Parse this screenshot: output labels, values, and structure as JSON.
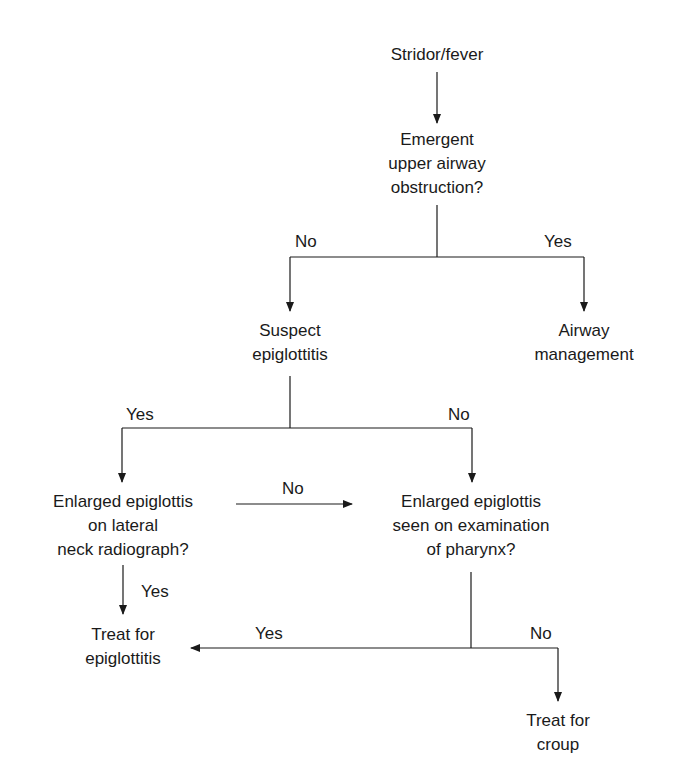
{
  "diagram": {
    "type": "flowchart",
    "nodes": {
      "start": {
        "lines": [
          "Stridor/fever"
        ]
      },
      "obstruction": {
        "lines": [
          "Emergent",
          "upper airway",
          "obstruction?"
        ]
      },
      "suspect": {
        "lines": [
          "Suspect",
          "epiglottitis"
        ]
      },
      "airway": {
        "lines": [
          "Airway",
          "management"
        ]
      },
      "radiograph": {
        "lines": [
          "Enlarged epiglottis",
          "on lateral",
          "neck radiograph?"
        ]
      },
      "pharynx": {
        "lines": [
          "Enlarged epiglottis",
          "seen on examination",
          "of pharynx?"
        ]
      },
      "treat_epi": {
        "lines": [
          "Treat for",
          "epiglottitis"
        ]
      },
      "treat_croup": {
        "lines": [
          "Treat for",
          "croup"
        ]
      }
    },
    "edge_labels": {
      "obstruction_no": "No",
      "obstruction_yes": "Yes",
      "suspect_yes": "Yes",
      "suspect_no": "No",
      "radiograph_no": "No",
      "radiograph_yes": "Yes",
      "pharynx_yes": "Yes",
      "pharynx_no": "No"
    },
    "edges": [
      {
        "from": "start",
        "to": "obstruction"
      },
      {
        "from": "obstruction",
        "to": "suspect",
        "label": "No"
      },
      {
        "from": "obstruction",
        "to": "airway",
        "label": "Yes"
      },
      {
        "from": "suspect",
        "to": "radiograph",
        "label": "Yes"
      },
      {
        "from": "suspect",
        "to": "pharynx",
        "label": "No"
      },
      {
        "from": "radiograph",
        "to": "pharynx",
        "label": "No"
      },
      {
        "from": "radiograph",
        "to": "treat_epi",
        "label": "Yes"
      },
      {
        "from": "pharynx",
        "to": "treat_epi",
        "label": "Yes"
      },
      {
        "from": "pharynx",
        "to": "treat_croup",
        "label": "No"
      }
    ],
    "line_color": "#1a1a1a"
  }
}
